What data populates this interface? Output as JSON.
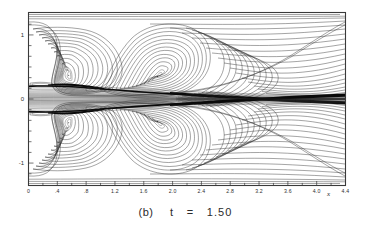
{
  "figure": {
    "caption": "(b)  t = 1.50",
    "caption_part_label": "(b)",
    "caption_part_variable": "t",
    "caption_part_equals": "=",
    "caption_part_value": "1.50",
    "type": "contour-plot"
  },
  "axes": {
    "x_axis_name": "x",
    "y_axis_name": "y",
    "x_ticks": [
      "0",
      ".4",
      ".8",
      "1.2",
      "1.6",
      "2.0",
      "2.4",
      "2.8",
      "3.2",
      "3.6",
      "4.0",
      "4.4"
    ],
    "x_tick_values": [
      0,
      0.4,
      0.8,
      1.2,
      1.6,
      2.0,
      2.4,
      2.8,
      3.2,
      3.6,
      4.0,
      4.4
    ],
    "y_ticks": [
      "1",
      "0",
      "-1"
    ],
    "y_tick_values": [
      1,
      0,
      -1
    ],
    "x_range": [
      0,
      4.4
    ],
    "y_range": [
      -1.35,
      1.35
    ],
    "x_minor_tick_step": 0.2,
    "y_minor_tick_step": 0.1666
  },
  "chart_data": {
    "type": "line",
    "xlabel": "x",
    "ylabel": "y",
    "xlim": [
      0,
      4.4
    ],
    "ylim": [
      -1.35,
      1.35
    ],
    "grid": false,
    "legend": "none",
    "categories": [
      "0",
      ".4",
      ".8",
      "1.2",
      "1.6",
      "2.0",
      "2.4",
      "2.8",
      "3.2",
      "3.6",
      "4.0",
      "4.4"
    ],
    "values": [
      0,
      0,
      0,
      0,
      0,
      0,
      0,
      0,
      0,
      0,
      0,
      0
    ],
    "series": [
      {
        "name": "upper-eddy-A-core",
        "x": [
          0.62
        ],
        "values": [
          0.62
        ]
      },
      {
        "name": "upper-eddy-B-core",
        "x": [
          1.62
        ],
        "values": [
          0.52
        ]
      },
      {
        "name": "lower-eddy-A-core",
        "x": [
          0.62
        ],
        "values": [
          -0.62
        ]
      },
      {
        "name": "lower-eddy-B-core",
        "x": [
          1.62
        ],
        "values": [
          -0.52
        ]
      },
      {
        "name": "centerline-shear-layer",
        "x": [
          0,
          4.4
        ],
        "values": [
          0,
          0
        ]
      }
    ],
    "annotations": [
      {
        "text": "(b)  t = 1.50",
        "position": "below-axes"
      },
      {
        "text": "x",
        "position": "x-axis-right"
      }
    ]
  },
  "colors": {
    "line": "#262626",
    "frame": "#3a3a3a",
    "background": "#ffffff",
    "dense_band": "#0a0a0a"
  }
}
